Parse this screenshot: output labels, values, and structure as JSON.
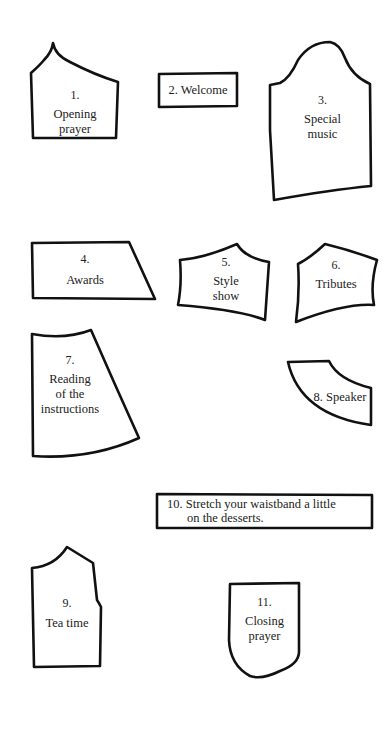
{
  "pieces": [
    {
      "number": "1.",
      "lines": [
        "Opening",
        "prayer"
      ]
    },
    {
      "label": "2. Welcome"
    },
    {
      "number": "3.",
      "lines": [
        "Special",
        "music"
      ]
    },
    {
      "number": "4.",
      "lines": [
        "Awards"
      ]
    },
    {
      "number": "5.",
      "lines": [
        "Style",
        "show"
      ]
    },
    {
      "number": "6.",
      "lines": [
        "Tributes"
      ]
    },
    {
      "number": "7.",
      "lines": [
        "Reading",
        "of the",
        "instructions"
      ]
    },
    {
      "label": "8. Speaker"
    },
    {
      "number": "9.",
      "lines": [
        "Tea time"
      ]
    },
    {
      "lines": [
        "10. Stretch your waistband a little",
        "on the desserts."
      ]
    },
    {
      "number": "11.",
      "lines": [
        "Closing",
        "prayer"
      ]
    }
  ]
}
